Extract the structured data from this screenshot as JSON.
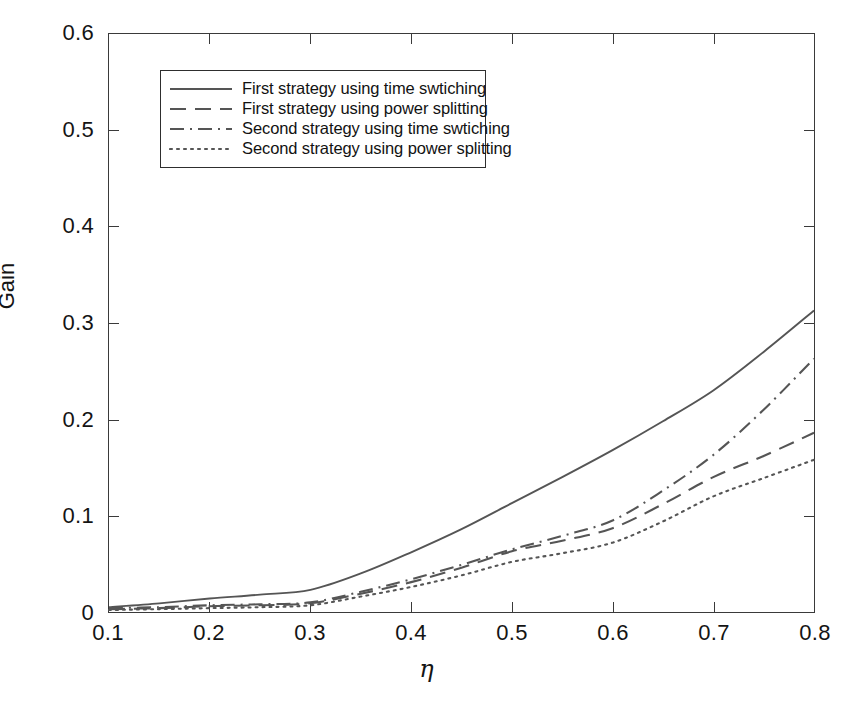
{
  "chart_data": {
    "type": "line",
    "title": "",
    "xlabel": "η",
    "ylabel": "Gain",
    "xlim": [
      0.1,
      0.8
    ],
    "ylim": [
      0,
      0.6
    ],
    "xticks": [
      "0.1",
      "0.2",
      "0.3",
      "0.4",
      "0.5",
      "0.6",
      "0.7",
      "0.8"
    ],
    "xtick_values": [
      0.1,
      0.2,
      0.3,
      0.4,
      0.5,
      0.6,
      0.7,
      0.8
    ],
    "yticks": [
      "0",
      "0.1",
      "0.2",
      "0.3",
      "0.4",
      "0.5",
      "0.6"
    ],
    "ytick_values": [
      0,
      0.1,
      0.2,
      0.3,
      0.4,
      0.5,
      0.6
    ],
    "grid": false,
    "legend_position": "upper left inside",
    "line_color": "#555555",
    "x": [
      0.1,
      0.15,
      0.2,
      0.25,
      0.3,
      0.35,
      0.4,
      0.45,
      0.5,
      0.55,
      0.6,
      0.65,
      0.7,
      0.75,
      0.8
    ],
    "series": [
      {
        "name": "First strategy using time swtiching",
        "style": "solid",
        "values": [
          0.005,
          0.009,
          0.014,
          0.018,
          0.023,
          0.04,
          0.062,
          0.086,
          0.113,
          0.14,
          0.168,
          0.198,
          0.23,
          0.27,
          0.313
        ]
      },
      {
        "name": "First strategy using power splitting",
        "style": "dashed",
        "values": [
          0.003,
          0.004,
          0.006,
          0.007,
          0.009,
          0.019,
          0.031,
          0.046,
          0.063,
          0.074,
          0.087,
          0.112,
          0.14,
          0.162,
          0.186
        ]
      },
      {
        "name": "Second strategy using time swtiching",
        "style": "dashdot",
        "values": [
          0.004,
          0.005,
          0.007,
          0.008,
          0.01,
          0.021,
          0.034,
          0.049,
          0.065,
          0.079,
          0.095,
          0.126,
          0.163,
          0.21,
          0.263
        ]
      },
      {
        "name": "Second strategy using power splitting",
        "style": "dotted",
        "values": [
          0.002,
          0.003,
          0.004,
          0.005,
          0.007,
          0.016,
          0.026,
          0.038,
          0.052,
          0.061,
          0.072,
          0.094,
          0.12,
          0.139,
          0.158
        ]
      }
    ]
  },
  "legend": {
    "entries": [
      {
        "label": "First strategy using time swtiching"
      },
      {
        "label": "First strategy using power splitting"
      },
      {
        "label": "Second strategy using time swtiching"
      },
      {
        "label": "Second strategy using power splitting"
      }
    ]
  }
}
